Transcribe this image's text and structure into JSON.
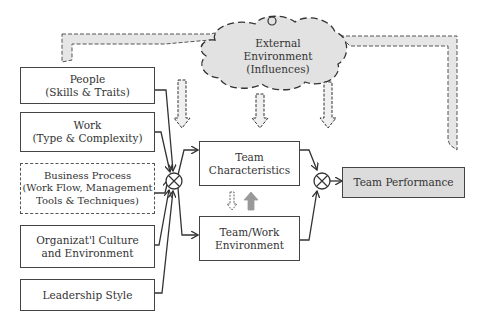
{
  "diagram": {
    "inputs": [
      {
        "line1": "People",
        "line2": "(Skills & Traits)",
        "style": "solid"
      },
      {
        "line1": "Work",
        "line2": "(Type & Complexity)",
        "style": "solid"
      },
      {
        "line1": "Business Process",
        "line2": "(Work Flow, Management",
        "line3": "Tools & Techniques)",
        "style": "dashed"
      },
      {
        "line1": "Organizat'l Culture",
        "line2": "and Environment",
        "style": "solid"
      },
      {
        "line1": "Leadership Style",
        "style": "solid"
      }
    ],
    "external": {
      "line1": "External",
      "line2": "Environment",
      "line3": "(Influences)"
    },
    "team_characteristics": {
      "line1": "Team",
      "line2": "Characteristics"
    },
    "team_work_environment": {
      "line1": "Team/Work",
      "line2": "Environment"
    },
    "output": {
      "label": "Team Performance",
      "fill": "#dcdcdc"
    },
    "junctions": [
      "summing-junction-inputs",
      "summing-junction-output"
    ]
  }
}
